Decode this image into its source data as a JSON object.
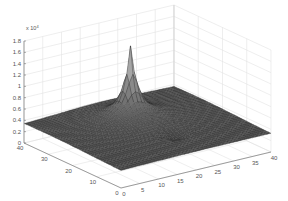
{
  "chart_data": {
    "type": "surface3d",
    "title": "",
    "xlabel": "",
    "ylabel": "",
    "zlabel": "",
    "x_ticks": [
      0,
      5,
      10,
      15,
      20,
      25,
      30,
      35,
      40
    ],
    "y_ticks": [
      0,
      10,
      20,
      30,
      40
    ],
    "z_ticks": [
      0,
      0.2,
      0.4,
      0.6,
      0.8,
      1,
      1.2,
      1.4,
      1.6,
      1.8
    ],
    "z_multiplier": "x 10",
    "z_multiplier_exp": "4",
    "xlim": [
      0,
      40
    ],
    "ylim": [
      0,
      40
    ],
    "zlim": [
      0,
      1.8
    ],
    "grid": true,
    "peak": {
      "x": 20,
      "y": 27,
      "z": 1.65
    },
    "base_level": 0.3,
    "depression": {
      "x": 22,
      "y": 12,
      "z": 0.2
    },
    "colormap": "gray"
  }
}
